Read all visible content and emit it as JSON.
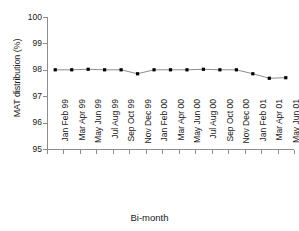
{
  "chart_data": {
    "type": "line",
    "title": "",
    "xlabel": "Bi-month",
    "ylabel": "MAT distribution (%)",
    "ylim": [
      95,
      100
    ],
    "yticks": [
      95,
      96,
      97,
      98,
      99,
      100
    ],
    "grid": false,
    "legend": "none",
    "marker": "square",
    "marker_color": "#000000",
    "line_color": "#6e6e6e",
    "axis_color": "#8c8c8c",
    "categories": [
      "Jan Feb 99",
      "Mar Apr 99",
      "May Jun 99",
      "Jul Aug 99",
      "Sep Oct 99",
      "Nov Dec 99",
      "Jan Feb 00",
      "Mar Apr 00",
      "May Jun 00",
      "Jul Aug 00",
      "Sep Oct 00",
      "Nov Dec 00",
      "Jan Feb 01",
      "Mar Apr 01",
      "May Jun 01"
    ],
    "values": [
      98.0,
      98.0,
      98.02,
      98.0,
      98.0,
      97.85,
      98.0,
      98.0,
      98.0,
      98.02,
      98.0,
      98.0,
      97.85,
      97.68,
      97.7
    ]
  }
}
